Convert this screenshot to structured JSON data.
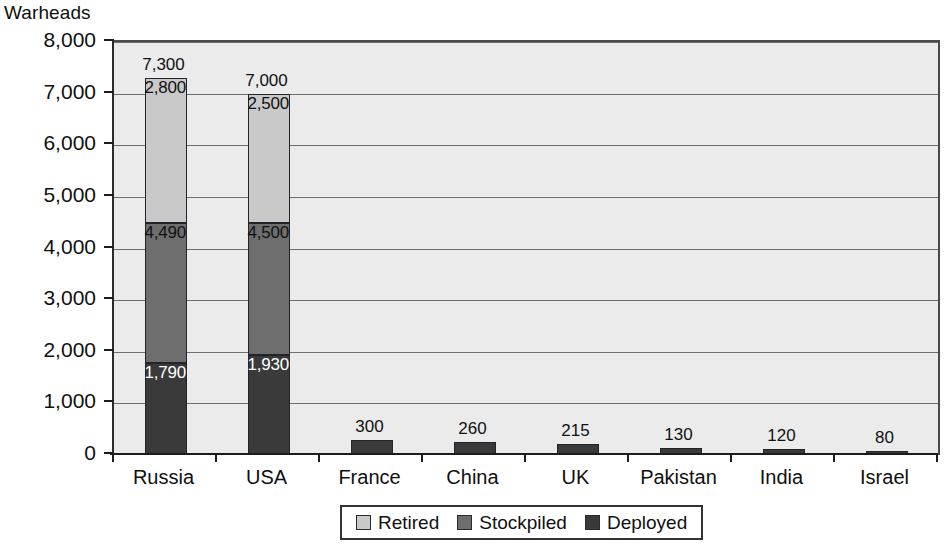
{
  "chart_data": {
    "type": "bar",
    "subtype": "stacked-bar",
    "title": "",
    "ylabel": "Warheads",
    "xlabel": "",
    "ylim": [
      0,
      8000
    ],
    "ytick_step": 1000,
    "ytick_labels": [
      "8,000",
      "7,000",
      "6,000",
      "5,000",
      "4,000",
      "3,000",
      "2,000",
      "1,000",
      "0"
    ],
    "ytick_values": [
      8000,
      7000,
      6000,
      5000,
      4000,
      3000,
      2000,
      1000,
      0
    ],
    "grid": true,
    "grid_axis": "y",
    "legend_position": "bottom-center",
    "categories": [
      "Russia",
      "USA",
      "France",
      "China",
      "UK",
      "Pakistan",
      "India",
      "Israel"
    ],
    "series": [
      {
        "name": "Deployed",
        "color": "#3a3a3a",
        "values": [
          1790,
          1930,
          300,
          260,
          215,
          130,
          120,
          80
        ]
      },
      {
        "name": "Stockpiled",
        "color": "#6e6e6e",
        "values": [
          2700,
          2570,
          0,
          0,
          0,
          0,
          0,
          0
        ]
      },
      {
        "name": "Retired",
        "color": "#c9c9c9",
        "values": [
          2810,
          2500,
          0,
          0,
          0,
          0,
          0,
          0
        ]
      }
    ],
    "totals": [
      7300,
      7000,
      300,
      260,
      215,
      130,
      120,
      80
    ],
    "total_labels": [
      "7,300",
      "7,000",
      "300",
      "260",
      "215",
      "130",
      "120",
      "80"
    ],
    "segment_boundary_labels": {
      "Russia": [
        "1,790",
        "4,490",
        "2,800"
      ],
      "USA": [
        "1,930",
        "4,500",
        "2,500"
      ]
    }
  },
  "axis": {
    "y_title": "Warheads",
    "ticks": [
      {
        "label": "8,000",
        "value": 8000
      },
      {
        "label": "7,000",
        "value": 7000
      },
      {
        "label": "6,000",
        "value": 6000
      },
      {
        "label": "5,000",
        "value": 5000
      },
      {
        "label": "4,000",
        "value": 4000
      },
      {
        "label": "3,000",
        "value": 3000
      },
      {
        "label": "2,000",
        "value": 2000
      },
      {
        "label": "1,000",
        "value": 1000
      },
      {
        "label": "0",
        "value": 0
      }
    ]
  },
  "bars": [
    {
      "category": "Russia",
      "total": 7300,
      "total_label": "7,300",
      "segments": [
        {
          "series": "Retired",
          "value": 2810,
          "cum_top": 7300,
          "label": "2,800",
          "label_color": "dark"
        },
        {
          "series": "Stockpiled",
          "value": 2700,
          "cum_top": 4490,
          "label": "4,490",
          "label_color": "dark"
        },
        {
          "series": "Deployed",
          "value": 1790,
          "cum_top": 1790,
          "label": "1,790",
          "label_color": "light"
        }
      ]
    },
    {
      "category": "USA",
      "total": 7000,
      "total_label": "7,000",
      "segments": [
        {
          "series": "Retired",
          "value": 2500,
          "cum_top": 7000,
          "label": "2,500",
          "label_color": "dark"
        },
        {
          "series": "Stockpiled",
          "value": 2570,
          "cum_top": 4500,
          "label": "4,500",
          "label_color": "dark"
        },
        {
          "series": "Deployed",
          "value": 1930,
          "cum_top": 1930,
          "label": "1,930",
          "label_color": "light"
        }
      ]
    },
    {
      "category": "France",
      "total": 300,
      "total_label": "300",
      "segments": [
        {
          "series": "Deployed",
          "value": 300,
          "cum_top": 300,
          "label": "",
          "label_color": "dark"
        }
      ]
    },
    {
      "category": "China",
      "total": 260,
      "total_label": "260",
      "segments": [
        {
          "series": "Deployed",
          "value": 260,
          "cum_top": 260,
          "label": "",
          "label_color": "dark"
        }
      ]
    },
    {
      "category": "UK",
      "total": 215,
      "total_label": "215",
      "segments": [
        {
          "series": "Deployed",
          "value": 215,
          "cum_top": 215,
          "label": "",
          "label_color": "dark"
        }
      ]
    },
    {
      "category": "Pakistan",
      "total": 130,
      "total_label": "130",
      "segments": [
        {
          "series": "Deployed",
          "value": 130,
          "cum_top": 130,
          "label": "",
          "label_color": "dark"
        }
      ]
    },
    {
      "category": "India",
      "total": 120,
      "total_label": "120",
      "segments": [
        {
          "series": "Deployed",
          "value": 120,
          "cum_top": 120,
          "label": "",
          "label_color": "dark"
        }
      ]
    },
    {
      "category": "Israel",
      "total": 80,
      "total_label": "80",
      "segments": [
        {
          "series": "Deployed",
          "value": 80,
          "cum_top": 80,
          "label": "",
          "label_color": "dark"
        }
      ]
    }
  ],
  "legend": {
    "items": [
      {
        "label": "Retired",
        "color": "#c9c9c9",
        "key": "retired"
      },
      {
        "label": "Stockpiled",
        "color": "#6e6e6e",
        "key": "stockpiled"
      },
      {
        "label": "Deployed",
        "color": "#3a3a3a",
        "key": "deployed"
      }
    ]
  },
  "colors": {
    "retired": "#c9c9c9",
    "stockpiled": "#6e6e6e",
    "deployed": "#3a3a3a",
    "plot_background": "#ebebeb",
    "page_background": "#ffffff",
    "gridline": "#6f6f6f",
    "axis": "#1c1c1c",
    "text": "#101010"
  }
}
